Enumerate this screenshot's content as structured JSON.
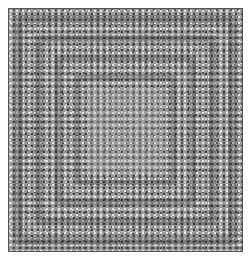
{
  "image": {
    "description": "Grayscale reaction-diffusion style dot texture with nested concentric rectangular bands",
    "colors": {
      "base": "#9a9a9a",
      "light_dot": "#e6e6e6",
      "dark_dot": "#3e3e3e",
      "border": "#555555"
    },
    "rings": [
      {
        "inset": 6,
        "width": 8
      },
      {
        "inset": 26,
        "width": 7
      },
      {
        "inset": 46,
        "width": 6
      },
      {
        "inset": 66,
        "width": 5
      }
    ]
  }
}
